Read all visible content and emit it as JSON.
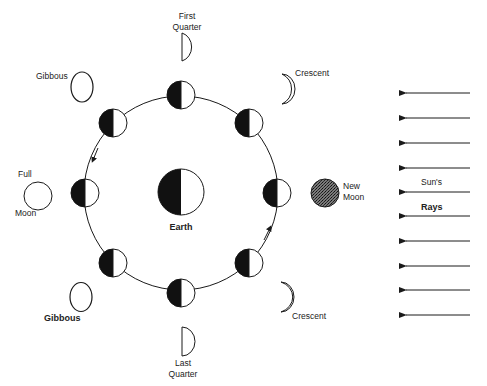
{
  "diagram": {
    "type": "moon-phases",
    "colors": {
      "ink": "#1a1a1a",
      "paper": "#ffffff",
      "new_moon_fill": "#555555"
    },
    "earth": {
      "label": "Earth",
      "cx": 181,
      "cy": 192,
      "r": 23
    },
    "orbit": {
      "cx": 181,
      "cy": 193,
      "r": 97,
      "direction": "counterclockwise"
    },
    "orbit_moons": [
      {
        "cx": 181,
        "cy": 95
      },
      {
        "cx": 113,
        "cy": 123
      },
      {
        "cx": 85,
        "cy": 193
      },
      {
        "cx": 113,
        "cy": 263
      },
      {
        "cx": 181,
        "cy": 293
      },
      {
        "cx": 249,
        "cy": 263
      },
      {
        "cx": 277,
        "cy": 193
      },
      {
        "cx": 249,
        "cy": 123
      }
    ],
    "phases": {
      "first_quarter": {
        "line1": "First",
        "line2": "Quarter"
      },
      "gibbous_upper": {
        "label": "Gibbous"
      },
      "crescent_upper": {
        "label": "Crescent"
      },
      "full_moon": {
        "line1": "Full",
        "line2": "Moon"
      },
      "new_moon": {
        "line1": "New",
        "line2": "Moon"
      },
      "gibbous_lower": {
        "label": "Gibbous"
      },
      "crescent_lower": {
        "label": "Crescent"
      },
      "last_quarter": {
        "line1": "Last",
        "line2": "Quarter"
      }
    },
    "sun": {
      "line1": "Sun's",
      "line2": "Rays",
      "ray_y": [
        93,
        118,
        143,
        168,
        192,
        216,
        241,
        266,
        290,
        315
      ],
      "ray_x_start": 470,
      "ray_x_end": 400
    }
  }
}
